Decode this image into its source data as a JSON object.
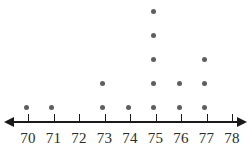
{
  "chart_data": {
    "type": "bar",
    "plot_style": "dot-plot",
    "title": "",
    "subtitle": "",
    "xlabel": "",
    "ylabel": "",
    "categories": [
      "70",
      "71",
      "72",
      "73",
      "74",
      "75",
      "76",
      "77",
      "78"
    ],
    "values": [
      1,
      1,
      0,
      2,
      1,
      5,
      2,
      3,
      0
    ],
    "tick_labels": [
      "70",
      "71",
      "72",
      "73",
      "74",
      "75",
      "76",
      "77",
      "78"
    ],
    "xlim": [
      70,
      78
    ],
    "ylim": [
      0,
      5
    ],
    "grid": false,
    "legend": null,
    "annotations": [],
    "axis": {
      "orientation": "horizontal",
      "left_arrow": true,
      "right_arrow": true,
      "ticks_above_line": true,
      "labels_below_line": true
    },
    "dot_color": "#5e5e5e",
    "axis_color": "#1a1a1a",
    "label_color": "#2b2b2b",
    "total_dots": 15
  },
  "layout": {
    "axis_y": 121,
    "baseline_dot_y": 107,
    "row_spacing": 24,
    "first_tick_x": 28,
    "tick_spacing": 25.5,
    "dot_offset_x": -2
  }
}
